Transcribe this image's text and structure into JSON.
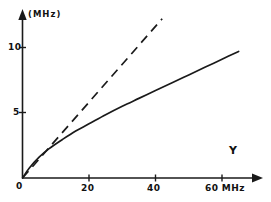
{
  "chart_data": {
    "type": "line",
    "title": "",
    "subtitle": "",
    "xlabel": "Y",
    "x_unit": "MHz",
    "ylabel": "(MHz)",
    "xlim": [
      0,
      68
    ],
    "ylim": [
      0,
      12.2
    ],
    "grid": false,
    "legend": "none",
    "x_ticks": [
      {
        "value": 0,
        "label": "0"
      },
      {
        "value": 20,
        "label": "20"
      },
      {
        "value": 40,
        "label": "40"
      },
      {
        "value": 60,
        "label": "60 MHz"
      }
    ],
    "y_ticks": [
      {
        "value": 5,
        "label": "5"
      },
      {
        "value": 10,
        "label": "10"
      }
    ],
    "series": [
      {
        "name": "solid-curve",
        "style": "solid",
        "color": "#1a1a1a",
        "x": [
          0,
          2,
          5,
          8,
          12,
          16,
          20,
          25,
          30,
          35,
          40,
          45,
          50,
          55,
          60,
          65
        ],
        "values": [
          0,
          0.75,
          1.6,
          2.25,
          2.95,
          3.6,
          4.15,
          4.85,
          5.5,
          6.1,
          6.7,
          7.3,
          7.9,
          8.5,
          9.1,
          9.7
        ]
      },
      {
        "name": "dashed-line",
        "style": "dashed",
        "color": "#1a1a1a",
        "x": [
          0,
          42
        ],
        "values": [
          0,
          12.2
        ]
      }
    ],
    "annotations": []
  },
  "axis": {
    "x_arrow": "arrow-right",
    "y_arrow": "arrow-up",
    "x_series_label": "Y",
    "y_unit_label": "(MHz)"
  }
}
